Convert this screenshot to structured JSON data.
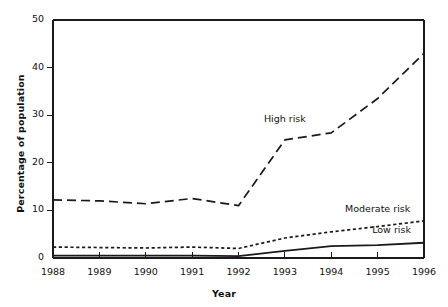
{
  "chart_data": {
    "type": "line",
    "title": "",
    "xlabel": "Year",
    "ylabel": "Percentage of population",
    "x": [
      1988,
      1989,
      1990,
      1991,
      1992,
      1993,
      1994,
      1995,
      1996
    ],
    "xtick_labels": [
      "1988",
      "1989",
      "1990",
      "1991",
      "1992",
      "1993",
      "1994",
      "1995",
      "1996"
    ],
    "ytick_labels": [
      "0",
      "10",
      "20",
      "30",
      "40",
      "50"
    ],
    "yticks": [
      0,
      10,
      20,
      30,
      40,
      50
    ],
    "ylim": [
      0,
      50
    ],
    "xlim": [
      1988,
      1996
    ],
    "grid": false,
    "legend_position": "inline-annotations",
    "series": [
      {
        "name": "High risk",
        "style": "long-dashed",
        "label_text": "High risk",
        "values": [
          12.2,
          12.0,
          11.4,
          12.5,
          11.0,
          24.8,
          26.3,
          33.5,
          43.0
        ]
      },
      {
        "name": "Moderate risk",
        "style": "short-dashed",
        "label_text": "Moderate risk",
        "values": [
          2.3,
          2.2,
          2.1,
          2.3,
          2.0,
          4.2,
          5.5,
          6.6,
          7.8
        ]
      },
      {
        "name": "Low risk",
        "style": "solid",
        "label_text": "Low risk",
        "values": [
          0.5,
          0.5,
          0.5,
          0.5,
          0.4,
          1.5,
          2.5,
          2.7,
          3.2
        ]
      }
    ],
    "annotations": [
      {
        "text": "High risk",
        "x": 1993.0,
        "y": 29.0
      },
      {
        "text": "Moderate risk",
        "x": 1995.0,
        "y": 10.0
      },
      {
        "text": "Low risk",
        "x": 1995.3,
        "y": 5.6
      }
    ],
    "colors": {
      "line": "#1a1a1a",
      "axis": "#1a1a1a",
      "background": "#ffffff",
      "text": "#111111"
    }
  }
}
